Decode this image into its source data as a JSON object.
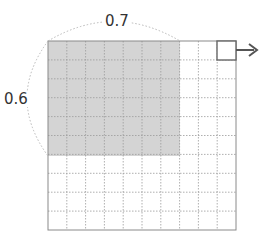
{
  "diagram": {
    "grid": {
      "rows": 10,
      "cols": 10,
      "left": 48,
      "top": 41,
      "right": 236,
      "bottom": 230
    },
    "shaded_region": {
      "cols": 7,
      "rows": 6,
      "color": "#d4d4d4"
    },
    "labels": {
      "width_fraction": "0.7",
      "height_fraction": "0.6"
    },
    "marker": {
      "shape": "square",
      "cell_col": 9,
      "cell_row": 0,
      "arrow": "right"
    },
    "colors": {
      "grid_border": "#8a8a8a",
      "grid_dashed": "#9a9a9a",
      "arc_dashed": "#b8b8b8",
      "arrow": "#555555",
      "marker_border": "#666666"
    }
  }
}
